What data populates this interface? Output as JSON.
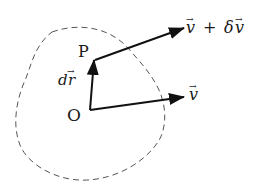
{
  "diagram": {
    "type": "vector-field-illustration",
    "region": {
      "style": "dashed-closed-curve",
      "color": "#555555"
    },
    "points": [
      {
        "id": "O",
        "label": "O"
      },
      {
        "id": "P",
        "label": "P"
      }
    ],
    "vectors": [
      {
        "id": "dr",
        "from": "O",
        "to": "P",
        "label_base": "d",
        "label_vec": "r"
      },
      {
        "id": "v",
        "from": "O",
        "label_vec": "v"
      },
      {
        "id": "v-plus-dv",
        "from": "P",
        "label_vec": "v",
        "label_op": "+",
        "label_delta": "δ",
        "label_vec2": "v"
      }
    ],
    "labels": {
      "O": "O",
      "P": "P",
      "dr_d": "d",
      "dr_r": "r",
      "v": "v",
      "vdv_v": "v",
      "vdv_plus": "+",
      "vdv_delta": "δ",
      "vdv_v2": "v",
      "vec_arrow": "→"
    },
    "colors": {
      "stroke": "#111111",
      "dash": "#555555",
      "background": "#ffffff"
    }
  }
}
